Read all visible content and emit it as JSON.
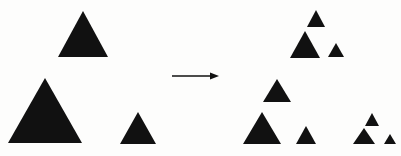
{
  "figure": {
    "width": 401,
    "height": 156,
    "background_color": "#fdfdfc",
    "shape_color": "#111111"
  },
  "chart_data": {
    "type": "diagram",
    "xlabel": "",
    "ylabel": "",
    "xlim": [
      0,
      401
    ],
    "ylim": [
      0,
      156
    ],
    "grid": false,
    "legend": "none",
    "annotations": [
      {
        "name": "transform-arrow",
        "kind": "arrow",
        "x1": 172,
        "y1": 76,
        "x2": 219,
        "y2": 76,
        "color": "#111111",
        "line_width": 1.6,
        "head_length": 9,
        "head_width": 7
      }
    ],
    "groups": [
      {
        "name": "left-input-set",
        "label": "Iteration 1",
        "triangle_count": 3,
        "triangles": [
          {
            "name": "left-top-triangle",
            "cx": 83,
            "base_y": 57,
            "apex_y": 11,
            "half_width": 25
          },
          {
            "name": "left-bottom-left-triangle",
            "cx": 45,
            "base_y": 143,
            "apex_y": 78,
            "half_width": 37
          },
          {
            "name": "left-bottom-right-triangle",
            "cx": 138,
            "base_y": 144,
            "apex_y": 112,
            "half_width": 18
          }
        ]
      },
      {
        "name": "right-output-set",
        "label": "Iteration 2",
        "triangle_count": 9,
        "clusters": [
          {
            "name": "right-top-cluster",
            "triangles": [
              {
                "name": "right-top-cluster-top-triangle",
                "cx": 316,
                "base_y": 27,
                "apex_y": 10,
                "half_width": 9
              },
              {
                "name": "right-top-cluster-bottom-left-triangle",
                "cx": 305,
                "base_y": 58,
                "apex_y": 31,
                "half_width": 15
              },
              {
                "name": "right-top-cluster-bottom-right-triangle",
                "cx": 336,
                "base_y": 57,
                "apex_y": 43,
                "half_width": 8
              }
            ]
          },
          {
            "name": "right-bottom-left-cluster",
            "triangles": [
              {
                "name": "right-bottom-left-cluster-top-triangle",
                "cx": 277,
                "base_y": 102,
                "apex_y": 79,
                "half_width": 14
              },
              {
                "name": "right-bottom-left-cluster-bottom-left-triangle",
                "cx": 262,
                "base_y": 144,
                "apex_y": 112,
                "half_width": 19
              },
              {
                "name": "right-bottom-left-cluster-bottom-right-triangle",
                "cx": 306,
                "base_y": 144,
                "apex_y": 126,
                "half_width": 10
              }
            ]
          },
          {
            "name": "right-bottom-right-cluster",
            "triangles": [
              {
                "name": "right-bottom-right-cluster-top-triangle",
                "cx": 372,
                "base_y": 126,
                "apex_y": 113,
                "half_width": 7
              },
              {
                "name": "right-bottom-right-cluster-bottom-left-triangle",
                "cx": 364,
                "base_y": 144,
                "apex_y": 128,
                "half_width": 11
              },
              {
                "name": "right-bottom-right-cluster-bottom-right-triangle",
                "cx": 390,
                "base_y": 144,
                "apex_y": 134,
                "half_width": 6
              }
            ]
          }
        ]
      }
    ]
  }
}
